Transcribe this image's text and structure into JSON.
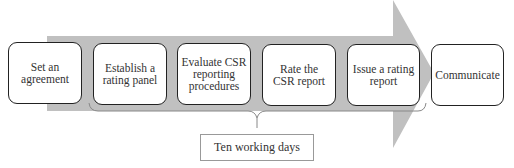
{
  "diagram": {
    "type": "process-flow",
    "arrow_color": "#c0c0c0",
    "steps": [
      {
        "label": "Set an agreement"
      },
      {
        "label": "Establish a rating panel"
      },
      {
        "label": "Evaluate CSR reporting procedures"
      },
      {
        "label": "Rate the CSR report"
      },
      {
        "label": "Issue a rating report"
      },
      {
        "label": "Communicate"
      }
    ],
    "bracket_label": "Ten working days"
  }
}
